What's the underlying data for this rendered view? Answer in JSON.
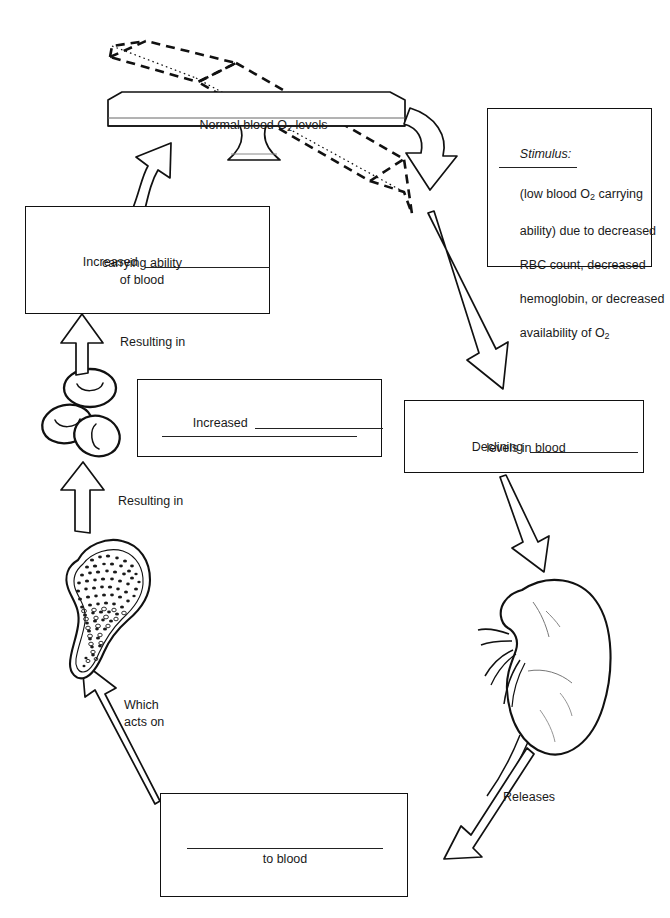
{
  "diagram": {
    "title_text": "Normal blood O2 levels",
    "type": "homeostatic-feedback-loop"
  },
  "balance": {
    "beam_label_pre": "Normal blood O",
    "beam_label_sub": "2",
    "beam_label_post": " levels"
  },
  "stimulus_box": {
    "heading": "Stimulus:",
    "line1": "(low blood O",
    "line1_sub": "2",
    "line1_post": " carrying",
    "line2": "ability) due to decreased",
    "line3": "RBC count, decreased",
    "line4": "hemoglobin, or decreased",
    "line5": "availability of O",
    "line5_sub": "2"
  },
  "increased_carrying_box": {
    "label": "Increased",
    "line2": "carrying ability",
    "line3": "of blood"
  },
  "increased_blank_box": {
    "label": "Increased"
  },
  "declining_box": {
    "label": "Declining",
    "line2": "levels in blood"
  },
  "to_blood_box": {
    "label": "to blood"
  },
  "connector_labels": {
    "resulting_in_top": "Resulting in",
    "resulting_in_bottom": "Resulting in",
    "which_acts_on_1": "Which",
    "which_acts_on_2": "acts on",
    "releases": "Releases"
  },
  "organs": {
    "red_blood_cells": "red-blood-cells",
    "bone_marrow": "bone-marrow",
    "kidney": "kidney"
  },
  "colors": {
    "stroke": "#111111",
    "fill": "#ffffff",
    "text": "#1a1a1a",
    "rule": "#222222"
  }
}
